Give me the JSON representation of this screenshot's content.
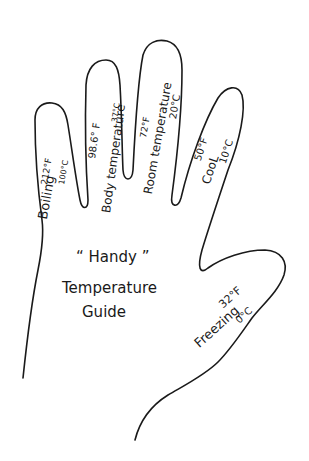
{
  "title": {
    "line1": "“ Handy ”",
    "line2": "Temperature",
    "line3": "Guide"
  },
  "fingers": [
    {
      "finger": "pinky",
      "fahrenheit": "212°F",
      "label": "Boiling",
      "celsius": "100°C"
    },
    {
      "finger": "ring",
      "fahrenheit": "98.6° F",
      "label": "Body temperature",
      "celsius": "37°C"
    },
    {
      "finger": "middle",
      "fahrenheit": "72°F",
      "label": "Room temperature",
      "celsius": "20°C"
    },
    {
      "finger": "index",
      "fahrenheit": "50°F",
      "label": "CooL",
      "celsius": "10°C"
    },
    {
      "finger": "thumb",
      "fahrenheit": "32°F",
      "label": "Freezing",
      "celsius": "0°C"
    }
  ],
  "colors": {
    "ink": "#1a1a1a",
    "paper": "#ffffff"
  }
}
